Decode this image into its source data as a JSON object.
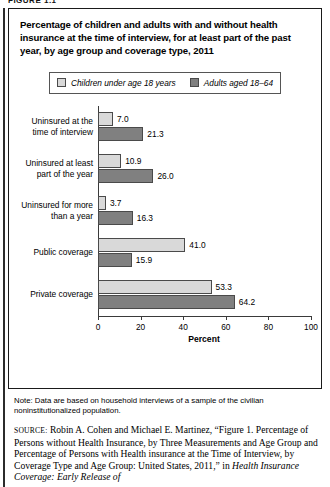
{
  "figure_label": "FIGURE 1.1",
  "title": "Percentage of children and adults with and without health insurance at the time of interview, for at least part of the past year, by age group and coverage type, 2011",
  "legend": {
    "series": [
      {
        "label": "Children under age 18 years",
        "swatch": "light-gray-swatch",
        "color": "#d9d9d9"
      },
      {
        "label": "Adults aged 18–64",
        "swatch": "dark-gray-swatch",
        "color": "#808080"
      }
    ]
  },
  "chart_data": {
    "type": "bar",
    "orientation": "horizontal",
    "title": "Percentage of children and adults with and without health insurance at the time of interview, for at least part of the past year, by age group and coverage type, 2011",
    "xlabel": "Percent",
    "ylabel": "",
    "xlim": [
      0,
      100
    ],
    "xticks": [
      0,
      20,
      40,
      60,
      80,
      100
    ],
    "xtick_labels": [
      "0",
      "20",
      "40",
      "60",
      "80",
      "100"
    ],
    "grid": false,
    "legend_position": "top-center",
    "categories": [
      "Uninsured at the time of interview",
      "Uninsured at least part of the year",
      "Uninsured for more than a year",
      "Public coverage",
      "Private coverage"
    ],
    "category_lines": [
      [
        "Uninsured at the",
        "time of interview"
      ],
      [
        "Uninsured at least",
        "part of the year"
      ],
      [
        "Uninsured for more",
        "than a year"
      ],
      [
        "Public coverage"
      ],
      [
        "Private coverage"
      ]
    ],
    "series": [
      {
        "name": "Children under age 18 years",
        "color": "#d9d9d9",
        "values": [
          7.0,
          10.9,
          3.7,
          41.0,
          53.3
        ],
        "labels": [
          "7.0",
          "10.9",
          "3.7",
          "41.0",
          "53.3"
        ]
      },
      {
        "name": "Adults aged 18–64",
        "color": "#808080",
        "values": [
          21.3,
          26.0,
          16.3,
          15.9,
          64.2
        ],
        "labels": [
          "21.3",
          "26.0",
          "16.3",
          "15.9",
          "64.2"
        ]
      }
    ]
  },
  "note": {
    "text": "Note: Data are based on household interviews of a sample of the civilian noninstitutionalized population."
  },
  "source": {
    "prefix": "SOURCE:",
    "plain_1": " Robin A. Cohen and Michael E. Martinez, “Figure 1. Percentage of Persons without Health Insurance, by Three Measurements and Age Group and Percentage of Persons with Health insurance at the Time of Interview, by Coverage Type and Age Group: United States, 2011,” in ",
    "italic_1": "Health Insurance Coverage: Early Release of"
  }
}
